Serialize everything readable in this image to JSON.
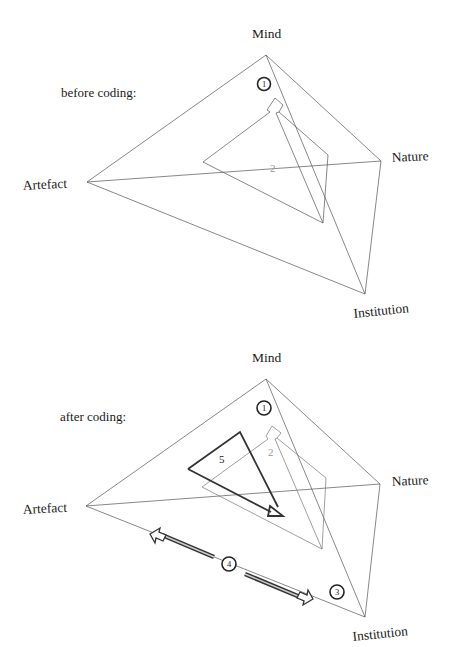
{
  "top_diagram": {
    "caption": "before coding:",
    "vertices": {
      "mind": "Mind",
      "nature": "Nature",
      "artefact": "Artefact",
      "institution": "Institution"
    },
    "markers": {
      "circle_1": "1",
      "label_2": "2"
    }
  },
  "bottom_diagram": {
    "caption": "after coding:",
    "vertices": {
      "mind": "Mind",
      "nature": "Nature",
      "artefact": "Artefact",
      "institution": "Institution"
    },
    "markers": {
      "circle_1": "1",
      "label_2": "2",
      "circle_3": "3",
      "circle_4": "4",
      "label_5": "5"
    }
  }
}
